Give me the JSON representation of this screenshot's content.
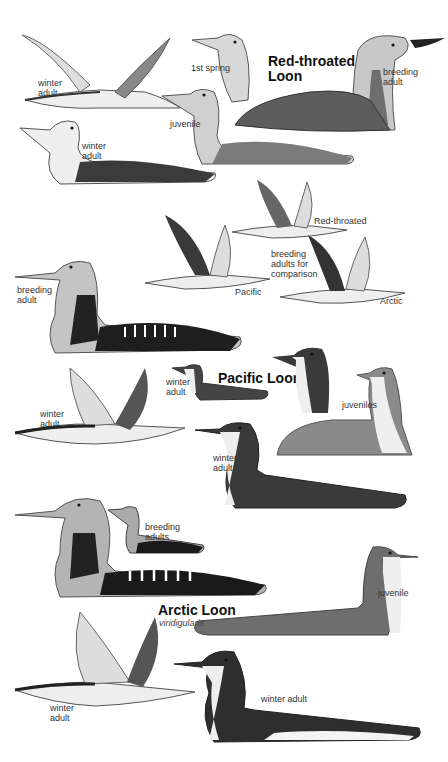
{
  "species": [
    {
      "title": "Red-throated\nLoon",
      "labels": {
        "winter_adult_flying": "winter\nadult",
        "first_spring": "1st spring",
        "breeding_adult": "breeding\nadult",
        "juvenile": "juvenile",
        "winter_adult_swimming": "winter\nadult"
      }
    },
    {
      "title": "Pacific Loon",
      "labels": {
        "breeding_adult": "breeding\nadult",
        "winter_adult_small": "winter\nadult",
        "winter_adult_flying": "winter\nadult",
        "juveniles": "juveniles",
        "winter_adult_swimming": "winter\nadult"
      }
    },
    {
      "title": "Arctic Loon",
      "subspecies": "viridigularis",
      "labels": {
        "breeding_adults": "breeding\nadults",
        "juvenile": "juvenile",
        "winter_adult_flying": "winter\nadult",
        "winter_adult_swimming": "winter adult"
      }
    }
  ],
  "comparison": {
    "caption": "breeding\nadults for\ncomparison",
    "red_throated": "Red-throated",
    "pacific": "Pacific",
    "arctic": "Arctic"
  },
  "colors": {
    "ink": "#222222",
    "mid_gray": "#7a7a7a",
    "light_gray": "#c9c9c9",
    "dark": "#1c1c1c",
    "water": "#bfbfbf"
  }
}
